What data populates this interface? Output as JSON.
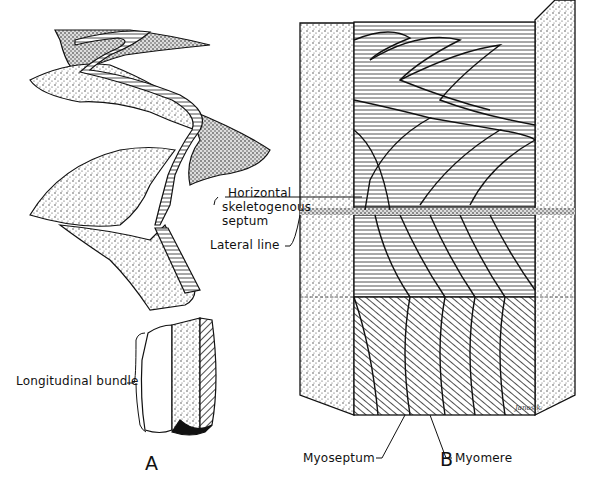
{
  "figure": {
    "panels": [
      {
        "id": "A",
        "label": "A"
      },
      {
        "id": "B",
        "label": "B"
      }
    ],
    "labels": {
      "horizontal_septum": [
        "Horizontal",
        "skeletogenous",
        "septum"
      ],
      "lateral_line": "Lateral line",
      "longitudinal_bundle": "Longitudinal bundle",
      "myoseptum": "Myoseptum",
      "myomere": "Myomere"
    },
    "signature": "Janosik",
    "colors": {
      "ink": "#111111",
      "background": "#ffffff",
      "stipple": "#555555"
    }
  }
}
